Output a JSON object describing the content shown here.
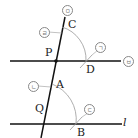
{
  "points": {
    "C": "C",
    "P": "P",
    "D": "D",
    "A": "A",
    "Q": "Q",
    "B": "B"
  },
  "line_label": "l",
  "steps": {
    "s1": "ㄱ",
    "s2": "ㄴ",
    "s3": "ㄷ",
    "s4": "ㄹ",
    "s5": "ㅁ",
    "s6": "ㅂ"
  },
  "colors": {
    "line": "#111111",
    "arc": "#999999"
  }
}
